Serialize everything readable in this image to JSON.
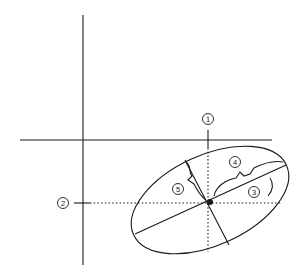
{
  "diagram": {
    "title": "",
    "colors": {
      "stroke": "#1a1a1a",
      "background": "#ffffff"
    },
    "labels": [
      {
        "id": "1",
        "text": "1",
        "x": 208,
        "y": 119
      },
      {
        "id": "2",
        "text": "2",
        "x": 63,
        "y": 203
      },
      {
        "id": "3",
        "text": "3",
        "x": 254,
        "y": 192
      },
      {
        "id": "4",
        "text": "4",
        "x": 235,
        "y": 162
      },
      {
        "id": "5",
        "text": "5",
        "x": 178,
        "y": 189
      }
    ]
  }
}
